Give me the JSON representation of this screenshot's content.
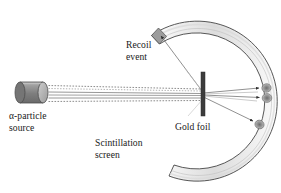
{
  "figure": {
    "background_color": "#ffffff",
    "width": 281,
    "height": 193
  },
  "labels": {
    "alpha_source": {
      "line1": "α-particle",
      "line2": "source"
    },
    "recoil_event": {
      "line1": "Recoil",
      "line2": "event"
    },
    "gold_foil": {
      "line1": "Gold foil"
    },
    "scintillation_screen": {
      "line1": "Scintillation",
      "line2": "screen"
    }
  },
  "colors": {
    "outline": "#3a3a3a",
    "screen_band_light": "#f2f2f2",
    "screen_band_mid": "#dcdcdc",
    "screen_band_dark": "#c6c6c6",
    "source_body": "#8c8c8c",
    "source_body_dark": "#6f6f6f",
    "source_cap": "#b4b4b4",
    "foil_bar": "#3c3c3c",
    "beam_line": "#8a8a8a",
    "scatter_ray": "#7a7a7a",
    "flash_spot": "#9a9a9a",
    "text": "#1a1a1a"
  },
  "components": {
    "alpha_source": {
      "name": "alpha-particle source",
      "shape": "cylinder",
      "x": 15,
      "y": 82,
      "width": 33,
      "height": 21
    },
    "gold_foil": {
      "name": "gold foil",
      "shape": "vertical-bar",
      "x": 201,
      "y": 72,
      "width": 4,
      "height": 44
    },
    "scintillation_screen": {
      "name": "scintillation screen",
      "shape": "circular-arc-band",
      "center_x": 195,
      "center_y": 96,
      "inner_radius": 68,
      "outer_radius": 80,
      "gap_opening": "upper-left"
    },
    "beam": {
      "name": "alpha particle beam",
      "from_x": 48,
      "to_x": 201,
      "center_y": 93,
      "dashed_lines": 2,
      "solid_lines": 3
    },
    "scatter_rays": [
      {
        "name": "recoil-ray",
        "to_x": 157,
        "to_y": 32,
        "deflection": "back-scatter"
      },
      {
        "name": "forward-ray-upper",
        "to_x": 262,
        "to_y": 88,
        "deflection": "small-angle"
      },
      {
        "name": "forward-ray-center",
        "to_x": 264,
        "to_y": 97,
        "deflection": "undeflected"
      },
      {
        "name": "forward-ray-lower",
        "to_x": 256,
        "to_y": 124,
        "deflection": "wide-angle"
      }
    ],
    "flash_spots": [
      {
        "name": "flash-recoil",
        "x": 157,
        "y": 31
      },
      {
        "name": "flash-upper",
        "x": 265,
        "y": 88
      },
      {
        "name": "flash-center",
        "x": 266,
        "y": 97
      },
      {
        "name": "flash-lower",
        "x": 259,
        "y": 124
      }
    ]
  }
}
